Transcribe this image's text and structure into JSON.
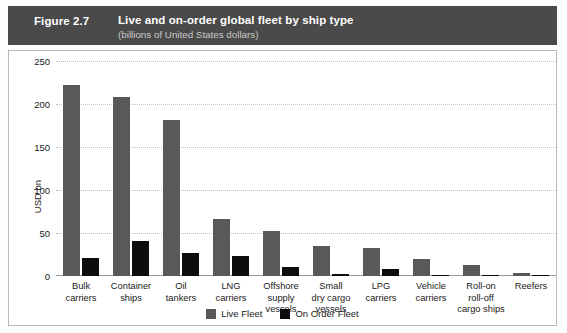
{
  "header": {
    "figure_number": "Figure 2.7",
    "title": "Live and on-order global fleet by ship type",
    "subtitle": "(billions of United States dollars)",
    "band_color": "#4a4a4a"
  },
  "legend": {
    "position": "bottom-center",
    "items": [
      {
        "label": "Live Fleet",
        "color": "#595959",
        "icon": "square-swatch"
      },
      {
        "label": "On Order Fleet",
        "color": "#0d0d0d",
        "icon": "square-swatch"
      }
    ]
  },
  "chart_data": {
    "type": "bar",
    "title": "Live and on-order global fleet by ship type",
    "subtitle": "(billions of United States dollars)",
    "xlabel": "",
    "ylabel": "USD bn",
    "ylim": [
      0,
      250
    ],
    "yticks": [
      0,
      50,
      100,
      150,
      200,
      250
    ],
    "ytick_labels": [
      "0",
      "50",
      "100",
      "150",
      "200",
      "250"
    ],
    "grid": true,
    "grid_axis": "y",
    "grid_style": "dotted",
    "legend_position": "bottom-center",
    "categories": [
      "Bulk carriers",
      "Container ships",
      "Oil tankers",
      "LNG carriers",
      "Offshore supply vessels",
      "Small dry cargo vessels",
      "LPG carriers",
      "Vehicle carriers",
      "Roll-on roll-off cargo ships",
      "Reefers"
    ],
    "category_label_lines": [
      [
        "Bulk",
        "carriers"
      ],
      [
        "Container",
        "ships"
      ],
      [
        "Oil",
        "tankers"
      ],
      [
        "LNG",
        "carriers"
      ],
      [
        "Offshore",
        "supply",
        "vessels"
      ],
      [
        "Small",
        "dry cargo",
        "vessels"
      ],
      [
        "LPG",
        "carriers"
      ],
      [
        "Vehicle",
        "carriers"
      ],
      [
        "Roll-on",
        "roll-off",
        "cargo ships"
      ],
      [
        "Reefers"
      ]
    ],
    "series": [
      {
        "name": "Live Fleet",
        "color": "#595959",
        "values": [
          222,
          208,
          181,
          66,
          52,
          35,
          33,
          20,
          13,
          3
        ]
      },
      {
        "name": "On Order Fleet",
        "color": "#0d0d0d",
        "values": [
          21,
          41,
          27,
          23,
          11,
          2,
          8,
          1,
          1,
          0.5
        ]
      }
    ]
  }
}
